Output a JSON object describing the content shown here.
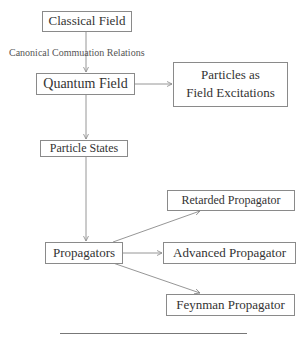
{
  "diagram": {
    "nodes": {
      "classical_field": "Classical Field",
      "quantum_field": "Quantum Field",
      "particles_line1": "Particles as",
      "particles_line2": "Field Excitations",
      "particle_states": "Particle States",
      "propagators": "Propagators",
      "retarded": "Retarded Propagator",
      "advanced": "Advanced Propagator",
      "feynman": "Feynman Propagator"
    },
    "edge_labels": {
      "classical_to_quantum": "Canonical Commuation Relations"
    },
    "edges": [
      {
        "from": "Classical Field",
        "to": "Quantum Field",
        "label": "Canonical Commuation Relations"
      },
      {
        "from": "Quantum Field",
        "to": "Particles as Field Excitations"
      },
      {
        "from": "Quantum Field",
        "to": "Particle States"
      },
      {
        "from": "Particle States",
        "to": "Propagators"
      },
      {
        "from": "Propagators",
        "to": "Retarded Propagator"
      },
      {
        "from": "Propagators",
        "to": "Advanced Propagator"
      },
      {
        "from": "Propagators",
        "to": "Feynman Propagator"
      }
    ],
    "colors": {
      "line": "#8a8a8a",
      "text": "#333333"
    }
  }
}
